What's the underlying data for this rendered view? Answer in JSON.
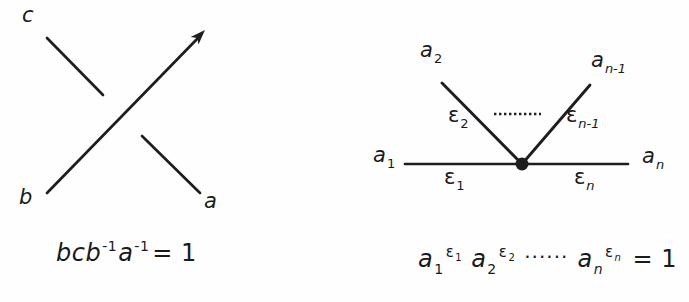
{
  "figure": {
    "colors": {
      "ink": "#1e1e1e",
      "background": "#fefefe"
    },
    "left_diagram": {
      "labels": {
        "top_left": "c",
        "bottom_left": "b",
        "bottom_right": "a"
      },
      "equation": {
        "b1": "b",
        "c": "c",
        "b2": "b",
        "exp1": "-1",
        "a": "a",
        "exp2": "-1",
        "rhs": "= 1"
      }
    },
    "right_diagram": {
      "labels": {
        "a2": {
          "base": "a",
          "sub": "2"
        },
        "an1": {
          "base": "a",
          "sub": "n-1"
        },
        "a1": {
          "base": "a",
          "sub": "1"
        },
        "an": {
          "base": "a",
          "sub": "n"
        },
        "eps2": {
          "base": "ε",
          "sub": "2"
        },
        "epsn1": {
          "base": "ε",
          "sub": "n-1"
        },
        "eps1": {
          "base": "ε",
          "sub": "1"
        },
        "epsn": {
          "base": "ε",
          "sub": "n"
        }
      },
      "equation": {
        "t1": {
          "base": "a",
          "sub": "1",
          "sup_base": "ε",
          "sup_sub": "1"
        },
        "t2": {
          "base": "a",
          "sub": "2",
          "sup_base": "ε",
          "sup_sub": "2"
        },
        "dots": "······",
        "t3": {
          "base": "a",
          "sub": "n",
          "sup_base": "ε",
          "sup_sub": "n"
        },
        "rhs": "= 1"
      }
    }
  }
}
